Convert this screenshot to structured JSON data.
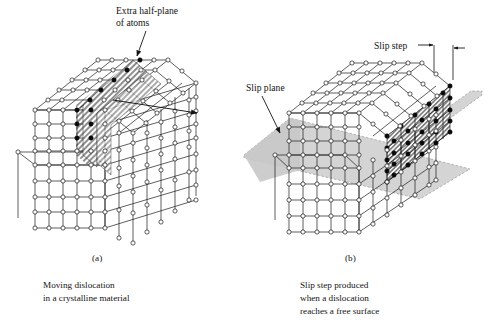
{
  "figure": {
    "background": "#ffffff",
    "width": 488,
    "height": 324,
    "colors": {
      "line": "#1a1a1a",
      "atom_open_fill": "#ffffff",
      "atom_filled": "#000000",
      "hatch_plane": "#9a9a9a",
      "slip_plane_fill": "#d2d2d2",
      "slip_plane_edge": "#8c8c8c",
      "text": "#141414"
    }
  },
  "panels": [
    {
      "id": "a",
      "panel_label": "(a)",
      "caption_lines": [
        "Moving dislocation",
        "in a crystalline material"
      ],
      "annotations": [
        {
          "name": "extra-half-plane",
          "lines": [
            "Extra half-plane",
            "of atoms"
          ],
          "has_leader": true
        },
        {
          "name": "dislocation-motion-arrow",
          "lines": [],
          "has_leader": true
        }
      ],
      "lattice": {
        "top_rows": 5,
        "top_cols": 6,
        "front_rows": 4,
        "front_cols": 5,
        "side_cols": 5
      }
    },
    {
      "id": "b",
      "panel_label": "(b)",
      "caption_lines": [
        "Slip step produced",
        "when a dislocation",
        "reaches a free surface"
      ],
      "annotations": [
        {
          "name": "slip-plane",
          "lines": [
            "Slip plane"
          ],
          "has_leader": true
        },
        {
          "name": "slip-step",
          "lines": [
            "Slip step"
          ],
          "has_leader": true
        }
      ],
      "lattice": {
        "top_rows": 5,
        "top_cols": 6,
        "front_rows": 4,
        "front_cols": 5,
        "side_cols": 5
      }
    }
  ]
}
